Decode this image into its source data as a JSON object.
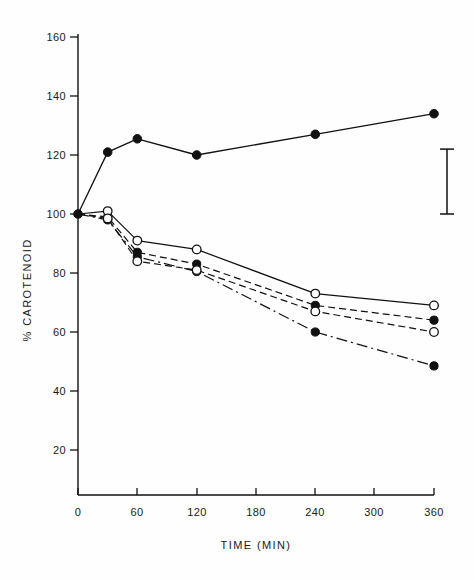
{
  "figure": {
    "background": "#fefefe",
    "ink_color": "#111111"
  },
  "chart_data": {
    "type": "line",
    "title": "",
    "subtitle": "",
    "xlabel": "TIME (MIN)",
    "ylabel": "% CAROTENOID",
    "xlim": [
      0,
      360
    ],
    "ylim": [
      0,
      165
    ],
    "xticks": [
      0,
      60,
      120,
      180,
      240,
      300,
      360
    ],
    "xtick_labels": [
      "0",
      "60",
      "120",
      "180",
      "240",
      "300",
      "360"
    ],
    "yticks": [
      20,
      40,
      60,
      80,
      100,
      120,
      140,
      160
    ],
    "ytick_labels": [
      "20",
      "40",
      "60",
      "80",
      "100",
      "120",
      "140",
      "160"
    ],
    "grid": false,
    "legend_position": "none",
    "x": [
      0,
      30,
      60,
      120,
      240,
      360
    ],
    "series": [
      {
        "name": "series-1",
        "marker": "filled-circle",
        "line_style": "solid",
        "x": [
          0,
          30,
          60,
          120,
          240,
          360
        ],
        "values": [
          100,
          121,
          125.5,
          120,
          127,
          134
        ]
      },
      {
        "name": "series-2",
        "marker": "open-circle",
        "line_style": "solid",
        "x": [
          0,
          30,
          60,
          120,
          240,
          360
        ],
        "values": [
          100,
          101,
          91,
          88,
          73,
          69
        ]
      },
      {
        "name": "series-3",
        "marker": "filled-circle",
        "line_style": "dashed",
        "x": [
          0,
          30,
          60,
          120,
          240,
          360
        ],
        "values": [
          100,
          99,
          87,
          83,
          69,
          64
        ]
      },
      {
        "name": "series-4",
        "marker": "open-circle",
        "line_style": "dashed",
        "x": [
          0,
          30,
          60,
          120,
          240,
          360
        ],
        "values": [
          100,
          98.5,
          84,
          81,
          67,
          60
        ]
      },
      {
        "name": "series-5",
        "marker": "filled-circle",
        "line_style": "dash-dot",
        "x": [
          0,
          30,
          60,
          120,
          240,
          360
        ],
        "values": [
          100,
          98,
          85.5,
          80.5,
          60,
          48.5
        ]
      }
    ],
    "annotations": [
      {
        "name": "error-bar",
        "type": "vertical-error-bar",
        "x": 378,
        "y_low": 100,
        "y_high": 122
      }
    ]
  }
}
